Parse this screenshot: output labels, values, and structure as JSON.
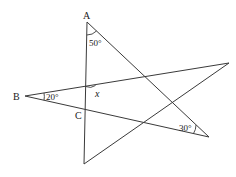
{
  "diagram": {
    "type": "geometry-star-figure",
    "points": {
      "A": {
        "label": "A",
        "x": 87,
        "y": 22
      },
      "B": {
        "label": "B",
        "x": 25,
        "y": 96
      },
      "C": {
        "label": "C",
        "x": 85,
        "y": 109
      },
      "bottom": {
        "x": 84,
        "y": 164
      },
      "right_top": {
        "x": 229,
        "y": 63
      },
      "bottom_right": {
        "x": 209,
        "y": 137
      }
    },
    "labels": {
      "A": "A",
      "B": "B",
      "C": "C",
      "angle_A": "50°",
      "angle_B": "20°",
      "angle_x": "x",
      "angle_bottom_right": "30°"
    },
    "colors": {
      "line": "#3a3a3a",
      "text": "#1a1a1a",
      "background": "#ffffff"
    }
  }
}
